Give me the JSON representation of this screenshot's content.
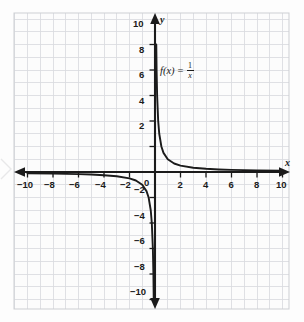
{
  "figure": {
    "kind": "coordinate-grid-graph",
    "background_color": "#fdfdfd",
    "grid_color": "#d8dade",
    "minor_grid_color": "#e9eaec",
    "axis_color": "#1b1b1b",
    "curve_color": "#1b1b1b"
  },
  "labels": {
    "x_axis_letter": "x",
    "y_axis_letter": "y",
    "origin": "0",
    "function_name": "f(x)",
    "function_equals": "=",
    "function_numerator": "1",
    "function_denominator": "x",
    "function_text": "f(x) = 1/x"
  },
  "chart_data": {
    "type": "line",
    "title": "",
    "subtitle": "",
    "xlabel": "x",
    "ylabel": "y",
    "equation": "f(x) = 1/x",
    "xlim": [
      -10.8,
      10.8
    ],
    "ylim": [
      -10.8,
      10.8
    ],
    "grid": true,
    "grid_step": 1,
    "legend": "none",
    "annotations": [
      {
        "text": "f(x) = 1/x",
        "x": 0.6,
        "y": 6.4
      }
    ],
    "xticks": [
      -10,
      -8,
      -6,
      -4,
      -2,
      0,
      2,
      4,
      6,
      8,
      10
    ],
    "xtick_labels": [
      "−10",
      "−8",
      "−6",
      "−4",
      "−2",
      "0",
      "2",
      "4",
      "6",
      "8",
      "10"
    ],
    "yticks": [
      -10,
      -8,
      -6,
      -4,
      -2,
      0,
      2,
      4,
      6,
      8,
      10
    ],
    "ytick_labels": [
      "−10",
      "−8",
      "−6",
      "−4",
      "−2",
      "0",
      "2",
      "4",
      "6",
      "8",
      "10"
    ],
    "series": [
      {
        "name": "f(x) = 1/x (x > 0)",
        "branch": "right",
        "points": [
          {
            "x": 0.1,
            "y": 10.0
          },
          {
            "x": 0.125,
            "y": 8.0
          },
          {
            "x": 0.1667,
            "y": 6.0
          },
          {
            "x": 0.25,
            "y": 4.0
          },
          {
            "x": 0.3333,
            "y": 3.0
          },
          {
            "x": 0.5,
            "y": 2.0
          },
          {
            "x": 0.6667,
            "y": 1.5
          },
          {
            "x": 1.0,
            "y": 1.0
          },
          {
            "x": 1.5,
            "y": 0.6667
          },
          {
            "x": 2.0,
            "y": 0.5
          },
          {
            "x": 3.0,
            "y": 0.3333
          },
          {
            "x": 4.0,
            "y": 0.25
          },
          {
            "x": 5.0,
            "y": 0.2
          },
          {
            "x": 6.0,
            "y": 0.1667
          },
          {
            "x": 8.0,
            "y": 0.125
          },
          {
            "x": 10.0,
            "y": 0.1
          },
          {
            "x": 10.8,
            "y": 0.0926
          }
        ]
      },
      {
        "name": "f(x) = 1/x (x < 0)",
        "branch": "left",
        "points": [
          {
            "x": -10.8,
            "y": -0.0926
          },
          {
            "x": -10.0,
            "y": -0.1
          },
          {
            "x": -8.0,
            "y": -0.125
          },
          {
            "x": -6.0,
            "y": -0.1667
          },
          {
            "x": -5.0,
            "y": -0.2
          },
          {
            "x": -4.0,
            "y": -0.25
          },
          {
            "x": -3.0,
            "y": -0.3333
          },
          {
            "x": -2.0,
            "y": -0.5
          },
          {
            "x": -1.5,
            "y": -0.6667
          },
          {
            "x": -1.0,
            "y": -1.0
          },
          {
            "x": -0.6667,
            "y": -1.5
          },
          {
            "x": -0.5,
            "y": -2.0
          },
          {
            "x": -0.3333,
            "y": -3.0
          },
          {
            "x": -0.25,
            "y": -4.0
          },
          {
            "x": -0.1667,
            "y": -6.0
          },
          {
            "x": -0.125,
            "y": -8.0
          },
          {
            "x": -0.1,
            "y": -10.0
          }
        ]
      }
    ],
    "asymptotes": [
      {
        "type": "vertical",
        "value": 0
      },
      {
        "type": "horizontal",
        "value": 0
      }
    ]
  }
}
